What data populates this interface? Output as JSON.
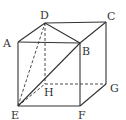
{
  "diagram": {
    "type": "cube",
    "vertices": {
      "A": {
        "label": "A",
        "x": 18,
        "y": 42
      },
      "B": {
        "label": "B",
        "x": 80,
        "y": 43
      },
      "C": {
        "label": "C",
        "x": 106,
        "y": 22
      },
      "D": {
        "label": "D",
        "x": 45,
        "y": 23
      },
      "E": {
        "label": "E",
        "x": 18,
        "y": 106
      },
      "F": {
        "label": "F",
        "x": 80,
        "y": 106
      },
      "G": {
        "label": "G",
        "x": 106,
        "y": 84
      },
      "H": {
        "label": "H",
        "x": 45,
        "y": 84
      }
    },
    "solid_edges": [
      "AB",
      "BC",
      "CD",
      "DA",
      "AE",
      "BF",
      "CG",
      "EF",
      "FG",
      "BD",
      "EB"
    ],
    "dashed_edges": [
      "DH",
      "EH",
      "HG",
      "ED"
    ],
    "line_color": "#333333"
  }
}
